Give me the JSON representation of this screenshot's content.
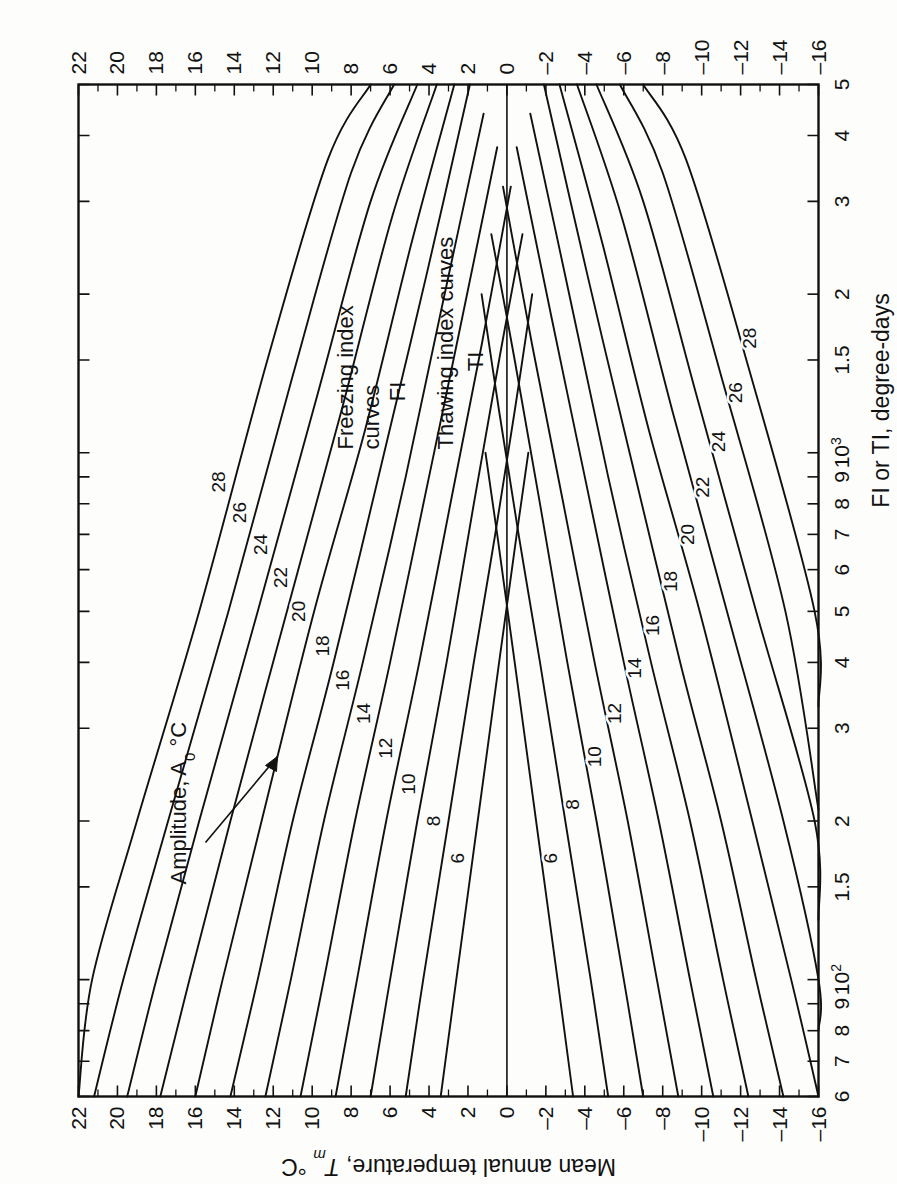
{
  "figure": {
    "kind": "scientific-line-chart",
    "orientation_note": "figure rendered landscape then rotated 90 degrees counter-clockwise"
  },
  "annotations": {
    "amplitude_label": "Amplitude, A",
    "amplitude_sub": "0",
    "amplitude_unit": "°C",
    "freezing_line1": "Freezing index",
    "freezing_line2": "curves",
    "freezing_line3": "FI",
    "thawing_line1": "Thawing index curves",
    "thawing_line2": "TI"
  },
  "axes": {
    "x": {
      "title": "FI or TI, degree-days",
      "scale": "log",
      "min": 60,
      "max": 5000,
      "tick_labels": [
        "6",
        "7",
        "8",
        "9",
        "10",
        "1.5",
        "2",
        "3",
        "4",
        "5",
        "6",
        "7",
        "8",
        "9",
        "10",
        "1.5",
        "2",
        "3",
        "4",
        "5"
      ],
      "decade_labels": [
        "10",
        "10"
      ],
      "decade_exponents": [
        "2",
        "3"
      ],
      "major_values": [
        60,
        70,
        80,
        90,
        100,
        150,
        200,
        300,
        400,
        500,
        600,
        700,
        800,
        900,
        1000,
        1500,
        2000,
        3000,
        4000,
        5000
      ]
    },
    "y": {
      "title_main": "Mean annual temperature, ",
      "title_sym": "T",
      "title_sub": "m",
      "title_unit": " °C",
      "min": -16,
      "max": 22,
      "tick_labels": [
        "22",
        "20",
        "18",
        "16",
        "14",
        "12",
        "10",
        "8",
        "6",
        "4",
        "2",
        "0",
        "–2",
        "–4",
        "–6",
        "–8",
        "–10",
        "–12",
        "–14",
        "–16"
      ],
      "tick_values": [
        22,
        20,
        18,
        16,
        14,
        12,
        10,
        8,
        6,
        4,
        2,
        0,
        -2,
        -4,
        -6,
        -8,
        -10,
        -12,
        -14,
        -16
      ]
    }
  },
  "chart_data": {
    "type": "line",
    "title": "",
    "subtitle": "",
    "xlabel": "FI or TI, degree-days",
    "ylabel": "Mean annual temperature, Tm °C",
    "xscale": "log",
    "xlim": [
      60,
      5000
    ],
    "ylim": [
      -16,
      22
    ],
    "grid": false,
    "legend": "inline curve labels",
    "legend_entries": [
      "Freezing index curves FI",
      "Thawing index curves TI"
    ],
    "annotations": [
      "Amplitude, A0 °C"
    ],
    "amplitudes": [
      6,
      8,
      10,
      12,
      14,
      16,
      18,
      20,
      22,
      24,
      26,
      28
    ],
    "amplitude_unit": "°C",
    "series": [
      {
        "name": "FI A0=6",
        "family": "freezing",
        "amplitude": 6,
        "label": "6",
        "x": [
          60,
          100,
          200,
          400,
          700,
          1000
        ],
        "y": [
          3.4,
          2.6,
          1.5,
          0.4,
          -0.5,
          -1.1
        ]
      },
      {
        "name": "FI A0=8",
        "family": "freezing",
        "amplitude": 8,
        "label": "8",
        "x": [
          60,
          100,
          200,
          400,
          700,
          1200,
          2000
        ],
        "y": [
          5.2,
          4.3,
          3.0,
          1.7,
          0.6,
          -0.4,
          -1.3
        ]
      },
      {
        "name": "FI A0=10",
        "family": "freezing",
        "amplitude": 10,
        "label": "10",
        "x": [
          60,
          100,
          200,
          400,
          800,
          1500,
          2600
        ],
        "y": [
          7.0,
          6.0,
          4.6,
          3.1,
          1.7,
          0.4,
          -0.8
        ]
      },
      {
        "name": "FI A0=12",
        "family": "freezing",
        "amplitude": 12,
        "label": "12",
        "x": [
          60,
          100,
          200,
          400,
          800,
          1600,
          3200
        ],
        "y": [
          8.8,
          7.7,
          6.2,
          4.5,
          2.9,
          1.3,
          -0.2
        ]
      },
      {
        "name": "FI A0=14",
        "family": "freezing",
        "amplitude": 14,
        "label": "14",
        "x": [
          60,
          100,
          200,
          400,
          900,
          1800,
          3800
        ],
        "y": [
          10.6,
          9.4,
          7.8,
          6.0,
          4.0,
          2.3,
          0.5
        ]
      },
      {
        "name": "FI A0=16",
        "family": "freezing",
        "amplitude": 16,
        "label": "16",
        "x": [
          60,
          100,
          200,
          400,
          900,
          2000,
          4400
        ],
        "y": [
          12.4,
          11.1,
          9.4,
          7.4,
          5.2,
          3.2,
          1.2
        ]
      },
      {
        "name": "FI A0=18",
        "family": "freezing",
        "amplitude": 18,
        "label": "18",
        "x": [
          60,
          100,
          200,
          400,
          1000,
          2200,
          5000
        ],
        "y": [
          14.2,
          12.8,
          11.0,
          8.9,
          6.3,
          4.1,
          1.9
        ]
      },
      {
        "name": "FI A0=20",
        "family": "freezing",
        "amplitude": 20,
        "label": "20",
        "x": [
          60,
          100,
          200,
          500,
          1100,
          2500,
          5000
        ],
        "y": [
          16.0,
          14.6,
          12.6,
          9.9,
          7.3,
          4.9,
          2.7
        ]
      },
      {
        "name": "FI A0=22",
        "family": "freezing",
        "amplitude": 22,
        "label": "22",
        "x": [
          60,
          100,
          200,
          500,
          1200,
          2800,
          5000
        ],
        "y": [
          17.8,
          16.3,
          14.2,
          11.3,
          8.5,
          5.9,
          3.6
        ]
      },
      {
        "name": "FI A0=24",
        "family": "freezing",
        "amplitude": 24,
        "label": "24",
        "x": [
          60,
          100,
          200,
          500,
          1300,
          3000,
          5000
        ],
        "y": [
          19.5,
          18.0,
          15.8,
          12.8,
          9.7,
          7.0,
          4.6
        ]
      },
      {
        "name": "FI A0=26",
        "family": "freezing",
        "amplitude": 26,
        "label": "26",
        "x": [
          60,
          100,
          200,
          500,
          1400,
          3400,
          5000
        ],
        "y": [
          21.2,
          19.7,
          17.4,
          14.3,
          11.0,
          8.0,
          5.8
        ]
      },
      {
        "name": "FI A0=28",
        "family": "freezing",
        "amplitude": 28,
        "label": "28",
        "x": [
          60,
          100,
          200,
          500,
          1500,
          3600,
          5000
        ],
        "y": [
          22.0,
          21.3,
          19.0,
          15.8,
          12.3,
          9.2,
          7.0
        ]
      },
      {
        "name": "TI A0=6",
        "family": "thawing",
        "amplitude": 6,
        "label": "6",
        "x": [
          60,
          100,
          200,
          400,
          700,
          1000
        ],
        "y": [
          -3.4,
          -2.6,
          -1.5,
          -0.4,
          0.5,
          1.1
        ]
      },
      {
        "name": "TI A0=8",
        "family": "thawing",
        "amplitude": 8,
        "label": "8",
        "x": [
          60,
          100,
          200,
          400,
          700,
          1200,
          2000
        ],
        "y": [
          -5.2,
          -4.3,
          -3.0,
          -1.7,
          -0.6,
          0.4,
          1.3
        ]
      },
      {
        "name": "TI A0=10",
        "family": "thawing",
        "amplitude": 10,
        "label": "10",
        "x": [
          60,
          100,
          200,
          400,
          800,
          1500,
          2600
        ],
        "y": [
          -7.0,
          -6.0,
          -4.6,
          -3.1,
          -1.7,
          -0.4,
          0.8
        ]
      },
      {
        "name": "TI A0=12",
        "family": "thawing",
        "amplitude": 12,
        "label": "12",
        "x": [
          60,
          100,
          200,
          400,
          800,
          1600,
          3200
        ],
        "y": [
          -8.8,
          -7.7,
          -6.2,
          -4.5,
          -2.9,
          -1.3,
          0.2
        ]
      },
      {
        "name": "TI A0=14",
        "family": "thawing",
        "amplitude": 14,
        "label": "14",
        "x": [
          60,
          100,
          200,
          400,
          900,
          1800,
          3800
        ],
        "y": [
          -10.6,
          -9.4,
          -7.8,
          -6.0,
          -4.0,
          -2.3,
          -0.5
        ]
      },
      {
        "name": "TI A0=16",
        "family": "thawing",
        "amplitude": 16,
        "label": "16",
        "x": [
          60,
          100,
          200,
          400,
          900,
          2000,
          4400
        ],
        "y": [
          -12.4,
          -11.1,
          -9.4,
          -7.4,
          -5.2,
          -3.2,
          -1.2
        ]
      },
      {
        "name": "TI A0=18",
        "family": "thawing",
        "amplitude": 18,
        "label": "18",
        "x": [
          60,
          100,
          200,
          400,
          1000,
          2200,
          5000
        ],
        "y": [
          -14.2,
          -12.8,
          -11.0,
          -8.9,
          -6.3,
          -4.1,
          -1.9
        ]
      },
      {
        "name": "TI A0=20",
        "family": "thawing",
        "amplitude": 20,
        "label": "20",
        "x": [
          60,
          100,
          200,
          500,
          1100,
          2500,
          5000
        ],
        "y": [
          -16.0,
          -14.6,
          -12.6,
          -9.9,
          -7.3,
          -4.9,
          -2.7
        ]
      },
      {
        "name": "TI A0=22",
        "family": "thawing",
        "amplitude": 22,
        "label": "22",
        "x": [
          80,
          100,
          200,
          500,
          1200,
          2800,
          5000
        ],
        "y": [
          -16.0,
          -16.0,
          -14.2,
          -11.3,
          -8.5,
          -5.9,
          -3.6
        ]
      },
      {
        "name": "TI A0=24",
        "family": "thawing",
        "amplitude": 24,
        "label": "24",
        "x": [
          130,
          200,
          500,
          1300,
          3000,
          5000
        ],
        "y": [
          -16.0,
          -15.8,
          -12.8,
          -9.7,
          -7.0,
          -4.6
        ]
      },
      {
        "name": "TI A0=26",
        "family": "thawing",
        "amplitude": 26,
        "label": "26",
        "x": [
          210,
          500,
          1400,
          3400,
          5000
        ],
        "y": [
          -16.0,
          -14.3,
          -11.0,
          -8.0,
          -5.8
        ]
      },
      {
        "name": "TI A0=28",
        "family": "thawing",
        "amplitude": 28,
        "label": "28",
        "x": [
          330,
          500,
          1500,
          3600,
          5000
        ],
        "y": [
          -16.0,
          -15.8,
          -12.3,
          -9.2,
          -7.0
        ]
      }
    ]
  }
}
